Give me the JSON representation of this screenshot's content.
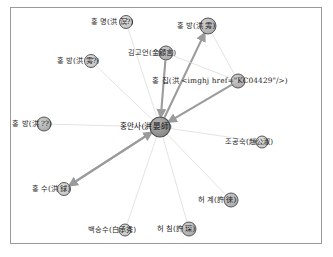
{
  "diagram": {
    "frame": {
      "visible": true,
      "border_color": "#9a9a9a"
    },
    "style": {
      "node_fill": "#b3b3b3",
      "node_fill_light": "#d0d0d0",
      "node_fill_central": "#8f8f8f",
      "node_stroke": "#4a4a4a",
      "edge_thick_color": "#9b9b9b",
      "edge_thin_color": "#d9d9d9",
      "label_color": "#1c1c1c"
    },
    "nodes": [
      {
        "id": "n1",
        "label": "홍 명(洪 溟?)",
        "cx": 126,
        "cy": 22,
        "r": 6.5,
        "tone": "light",
        "label_x": 112,
        "label_y": 22
      },
      {
        "id": "n2",
        "label": "홍 방(洪 雱)",
        "cx": 208,
        "cy": 26,
        "r": 8.0,
        "tone": "mid",
        "label_x": 196,
        "label_y": 26
      },
      {
        "id": "n3",
        "label": "김고언(金顧言)",
        "cx": 166,
        "cy": 53,
        "r": 7.0,
        "tone": "mid",
        "label_x": 152,
        "label_y": 53
      },
      {
        "id": "n4",
        "label": "홍 방(洪 雱?)",
        "cx": 91,
        "cy": 61,
        "r": 6.5,
        "tone": "light",
        "label_x": 78,
        "label_y": 61
      },
      {
        "id": "n5",
        "label": "홍 집(洪 <imghj href=\"KC04429\"/>)",
        "cx": 238,
        "cy": 81,
        "r": 7.0,
        "tone": "mid",
        "label_x": 220,
        "label_y": 81
      },
      {
        "id": "n6",
        "label": "홍 방(洪 ??)",
        "cx": 44,
        "cy": 124,
        "r": 7.0,
        "tone": "mid",
        "label_x": 32,
        "label_y": 124
      },
      {
        "id": "n7",
        "label": "홍안사(洪晏師)",
        "cx": 160,
        "cy": 127,
        "r": 10.0,
        "tone": "central",
        "label_x": 146,
        "label_y": 127
      },
      {
        "id": "n8",
        "label": "조공숙(趙公淑)",
        "cx": 262,
        "cy": 142,
        "r": 6.0,
        "tone": "light",
        "label_x": 249,
        "label_y": 142
      },
      {
        "id": "n9",
        "label": "홍 수(洪 銶)",
        "cx": 64,
        "cy": 189,
        "r": 6.5,
        "tone": "light",
        "label_x": 51,
        "label_y": 189
      },
      {
        "id": "n10",
        "label": "허 계(許 徠)",
        "cx": 231,
        "cy": 200,
        "r": 7.0,
        "tone": "mid",
        "label_x": 217,
        "label_y": 200
      },
      {
        "id": "n11",
        "label": "백승수(白承秀)",
        "cx": 125,
        "cy": 230,
        "r": 6.0,
        "tone": "light",
        "label_x": 112,
        "label_y": 230
      },
      {
        "id": "n12",
        "label": "허 침(許 琛)",
        "cx": 189,
        "cy": 229,
        "r": 7.0,
        "tone": "mid",
        "label_x": 176,
        "label_y": 229
      }
    ],
    "edges": [
      {
        "from": "n1",
        "to": "n7",
        "weight": "thin",
        "arrow": false
      },
      {
        "from": "n4",
        "to": "n7",
        "weight": "thin",
        "arrow": false
      },
      {
        "from": "n3",
        "to": "n7",
        "weight": "thin",
        "arrow": false
      },
      {
        "from": "n6",
        "to": "n7",
        "weight": "thin",
        "arrow": true
      },
      {
        "from": "n8",
        "to": "n7",
        "weight": "thin",
        "arrow": false
      },
      {
        "from": "n11",
        "to": "n7",
        "weight": "thin",
        "arrow": false
      },
      {
        "from": "n12",
        "to": "n7",
        "weight": "thin",
        "arrow": false
      },
      {
        "from": "n10",
        "to": "n7",
        "weight": "thin",
        "arrow": false
      },
      {
        "from": "n7",
        "to": "n2",
        "weight": "thick",
        "arrow": true
      },
      {
        "from": "n5",
        "to": "n7",
        "weight": "thick",
        "arrow": true
      },
      {
        "from": "n3",
        "to": "n5",
        "weight": "thin",
        "arrow": false
      },
      {
        "from": "n2",
        "to": "n5",
        "weight": "thin",
        "arrow": false
      },
      {
        "from": "n7",
        "to": "n9",
        "weight": "thick",
        "arrow": true
      },
      {
        "from": "n9",
        "to": "n7",
        "weight": "thick",
        "arrow": true
      },
      {
        "from": "n3",
        "to": "n7",
        "weight": "thick",
        "arrow": true
      }
    ]
  }
}
